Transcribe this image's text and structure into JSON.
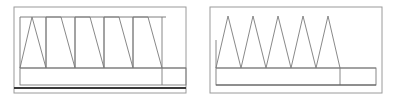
{
  "figure": {
    "title": "",
    "background": "#ffffff",
    "width": 396,
    "height": 103,
    "line_color": "#6b6b6b",
    "frame_color": "#8a8a8a",
    "baseline_color": "#3a3a3a",
    "stroke_width": 0.9
  },
  "panels": [
    {
      "id": "left-panel",
      "name": "sawtooth-elevation-panel",
      "frame": {
        "x": 14,
        "y": 7,
        "width": 172,
        "height": 86
      },
      "inner_top_line": {
        "x1": 20,
        "y1": 17,
        "x2": 166,
        "y2": 17
      },
      "mid_line": {
        "x1": 20,
        "y1": 68,
        "x2": 166,
        "y2": 68
      },
      "lower_band": {
        "x": 20,
        "y": 68,
        "width": 166,
        "height": 17
      },
      "band_split_x": 166,
      "baseline": {
        "x1": 14,
        "y1": 88,
        "x2": 186,
        "y2": 88,
        "thickness": 2.2
      },
      "wave": {
        "type": "sawtooth-with-verticals",
        "peak_y": 17,
        "base_y": 68,
        "start_x": 20,
        "end_x": 166,
        "peaks": 5,
        "peak_x": [
          32,
          61,
          90,
          119,
          148
        ],
        "valley_x": [
          20,
          46,
          75,
          104,
          133,
          162
        ],
        "vertical_dividers_x": [
          46,
          75,
          104,
          133,
          162
        ]
      },
      "notes": "zigzag with vertical drop lines at each valley"
    },
    {
      "id": "right-panel",
      "name": "triangle-wave-elevation-panel",
      "frame": {
        "x": 210,
        "y": 7,
        "width": 172,
        "height": 86
      },
      "mid_line": {
        "x1": 216,
        "y1": 68,
        "x2": 376,
        "y2": 68
      },
      "lower_band": {
        "x": 216,
        "y": 68,
        "width": 160,
        "height": 17
      },
      "band_split_x": 340,
      "baseline": {
        "x1": 216,
        "y1": 85,
        "x2": 376,
        "y2": 85,
        "thickness": 1.0
      },
      "wave": {
        "type": "triangle",
        "peak_y": 16,
        "base_y": 68,
        "start_x": 216,
        "end_x": 340,
        "peaks": 5,
        "peak_x": [
          228,
          253,
          278,
          303,
          328
        ],
        "valley_x": [
          216,
          241,
          266,
          291,
          316,
          340
        ],
        "vertical_dividers_x": []
      },
      "notes": "clean triangle wave, no vertical drop lines, no top rail"
    }
  ],
  "chart_data": {
    "type": "line",
    "title": "",
    "xlabel": "",
    "ylabel": "",
    "grid": false,
    "legend": null,
    "series": [
      {
        "name": "left-sawtooth",
        "x": [
          20,
          32,
          46,
          46,
          61,
          75,
          75,
          90,
          104,
          104,
          119,
          133,
          133,
          148,
          162
        ],
        "y": [
          68,
          17,
          68,
          17,
          17,
          68,
          17,
          17,
          68,
          17,
          17,
          68,
          17,
          17,
          68
        ]
      },
      {
        "name": "right-triangle",
        "x": [
          216,
          228,
          241,
          253,
          266,
          278,
          291,
          303,
          316,
          328,
          340
        ],
        "y": [
          68,
          16,
          68,
          16,
          68,
          16,
          68,
          16,
          68,
          16,
          68
        ]
      }
    ],
    "xlim": [
      0,
      396
    ],
    "ylim": [
      103,
      0
    ]
  }
}
